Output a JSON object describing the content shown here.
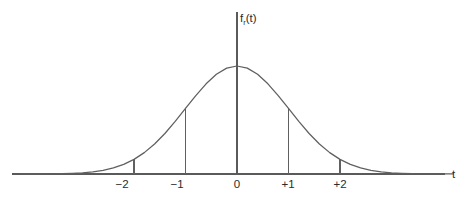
{
  "figure": {
    "name": "t-distribution-density-curve",
    "background_color": "#ffffff",
    "stroke_color": "#5f5f5f",
    "text_color": "#2b2b2b"
  },
  "axes": {
    "x_axis_label": "t",
    "y_axis_label_base": "f",
    "y_axis_label_subscript": "r",
    "y_axis_label_arg": "(t)",
    "y_axis_label_full": "fᵣ(t)"
  },
  "ticks": [
    {
      "label": "−2",
      "value": -2
    },
    {
      "label": "−1",
      "value": -1
    },
    {
      "label": "0",
      "value": 0
    },
    {
      "label": "+1",
      "value": 1
    },
    {
      "label": "+2",
      "value": 2
    }
  ],
  "chart_data": {
    "type": "line",
    "title": "",
    "subtitle": "",
    "xlabel": "t",
    "ylabel": "fᵣ(t)",
    "xlim": [
      -4.2,
      4.2
    ],
    "ylim": [
      0,
      0.44
    ],
    "grid": false,
    "legend": null,
    "tick_labels_x": [
      "−2",
      "−1",
      "0",
      "+1",
      "+2"
    ],
    "tick_values_x": [
      -2,
      -1,
      0,
      1,
      2
    ],
    "tick_labels_y": [],
    "annotations": [
      "vertical drop line from curve to axis at t = -2",
      "vertical drop line from curve to axis at t = -1",
      "vertical axis line at t = 0 extending above the curve peak",
      "vertical drop line from curve to axis at t = +1",
      "vertical drop line from curve to axis at t = +2"
    ],
    "series": [
      {
        "name": "t density",
        "x": [
          -4.2,
          -4.0,
          -3.8,
          -3.6,
          -3.4,
          -3.2,
          -3.0,
          -2.8,
          -2.6,
          -2.4,
          -2.2,
          -2.0,
          -1.8,
          -1.6,
          -1.4,
          -1.2,
          -1.0,
          -0.8,
          -0.6,
          -0.4,
          -0.2,
          0.0,
          0.2,
          0.4,
          0.6,
          0.8,
          1.0,
          1.2,
          1.4,
          1.6,
          1.8,
          2.0,
          2.2,
          2.4,
          2.6,
          2.8,
          3.0,
          3.2,
          3.4,
          3.6,
          3.8,
          4.0,
          4.2
        ],
        "y": [
          0.0001,
          0.0001,
          0.0003,
          0.0006,
          0.0012,
          0.0024,
          0.0044,
          0.0079,
          0.0136,
          0.0224,
          0.0355,
          0.054,
          0.079,
          0.1109,
          0.1497,
          0.1942,
          0.242,
          0.2897,
          0.3332,
          0.3683,
          0.391,
          0.3989,
          0.391,
          0.3683,
          0.3332,
          0.2897,
          0.242,
          0.1942,
          0.1497,
          0.1109,
          0.079,
          0.054,
          0.0355,
          0.0224,
          0.0136,
          0.0079,
          0.0044,
          0.0024,
          0.0012,
          0.0006,
          0.0003,
          0.0001,
          0.0001
        ]
      }
    ],
    "markers": [
      {
        "x": -2,
        "y": 0.054,
        "kind": "drop-line"
      },
      {
        "x": -1,
        "y": 0.242,
        "kind": "drop-line"
      },
      {
        "x": 0,
        "y": 0.3989,
        "kind": "axis-line"
      },
      {
        "x": 1,
        "y": 0.242,
        "kind": "drop-line"
      },
      {
        "x": 2,
        "y": 0.054,
        "kind": "drop-line"
      }
    ]
  },
  "geometry": {
    "baseline_y": 174,
    "axis_x_left": 12,
    "axis_x_right": 445,
    "center_x": 237,
    "y_axis_top": 12,
    "peak_y": 66,
    "pixels_per_unit_x": 51.5,
    "tick_x_positions": [
      122,
      177,
      237,
      288,
      340
    ],
    "tick_label_y": 188,
    "drop_tops": [
      160,
      118,
      66,
      118,
      160
    ],
    "x_label_pos": {
      "x": 452,
      "y": 178
    },
    "y_label_pos": {
      "x": 240,
      "y": 22
    }
  }
}
